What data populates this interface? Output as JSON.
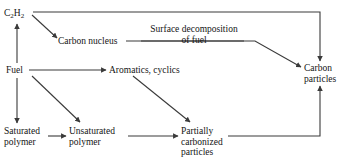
{
  "diagram": {
    "line_color": "#3a3a3a",
    "text_color": "#141414",
    "background": "#ffffff",
    "nodes": [
      {
        "id": "acetylene",
        "label": "C2H2",
        "label_parts": [
          "C",
          "2",
          "H",
          "2"
        ],
        "x": 4,
        "y": 8
      },
      {
        "id": "carbon-nucleus",
        "label": "Carbon nucleus",
        "x": 58,
        "y": 36
      },
      {
        "id": "fuel",
        "label": "Fuel",
        "x": 6,
        "y": 65
      },
      {
        "id": "aromatics-cyclics",
        "label": "Aromatics, cyclics",
        "x": 109,
        "y": 65
      },
      {
        "id": "carbon-particles",
        "label": "Carbon\nparticles",
        "x": 304,
        "y": 63
      },
      {
        "id": "saturated-polymer",
        "label": "Saturated\npolymer",
        "x": 4,
        "y": 126
      },
      {
        "id": "unsaturated-polymer",
        "label": "Unsaturated\npolymer",
        "x": 69,
        "y": 126
      },
      {
        "id": "partially-carbonized-particles",
        "label": "Partially\ncarbonized\nparticles",
        "x": 181,
        "y": 126
      }
    ],
    "edge_labels": [
      {
        "id": "surface-decomposition",
        "label": "Surface decomposition\nof fuel",
        "x": 144,
        "y": 24
      }
    ],
    "edges": [
      {
        "id": "fuel-to-acetylene",
        "from": "fuel",
        "to": "acetylene",
        "arrow": true
      },
      {
        "id": "acetylene-to-carbon-nucleus",
        "from": "acetylene",
        "to": "carbon-nucleus",
        "arrow": true
      },
      {
        "id": "acetylene-to-carbon-particles",
        "from": "acetylene",
        "to": "carbon-particles",
        "arrow": true
      },
      {
        "id": "carbon-nucleus-to-carbon-particles",
        "from": "carbon-nucleus",
        "to": "carbon-particles",
        "arrow": true
      },
      {
        "id": "fuel-to-aromatics",
        "from": "fuel",
        "to": "aromatics-cyclics",
        "arrow": true
      },
      {
        "id": "fuel-to-saturated-polymer",
        "from": "fuel",
        "to": "saturated-polymer",
        "arrow": true
      },
      {
        "id": "fuel-to-unsaturated-polymer",
        "from": "fuel",
        "to": "unsaturated-polymer",
        "arrow": true
      },
      {
        "id": "aromatics-to-partially-carbonized",
        "from": "aromatics-cyclics",
        "to": "partially-carbonized-particles",
        "arrow": true
      },
      {
        "id": "saturated-to-unsaturated",
        "from": "saturated-polymer",
        "to": "unsaturated-polymer",
        "arrow": true
      },
      {
        "id": "unsaturated-to-partially-carbonized",
        "from": "unsaturated-polymer",
        "to": "partially-carbonized-particles",
        "arrow": true
      },
      {
        "id": "partially-carbonized-to-carbon-particles",
        "from": "partially-carbonized-particles",
        "to": "carbon-particles",
        "arrow": true
      }
    ]
  }
}
